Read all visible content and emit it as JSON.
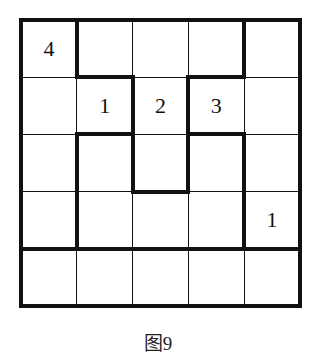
{
  "puzzle": {
    "rows": 5,
    "cols": 5,
    "cells": [
      [
        "4",
        "",
        "",
        "",
        ""
      ],
      [
        "",
        "1",
        "2",
        "3",
        ""
      ],
      [
        "",
        "",
        "",
        "",
        ""
      ],
      [
        "",
        "",
        "",
        "",
        "1"
      ],
      [
        "",
        "",
        "",
        "",
        ""
      ]
    ],
    "thick_vertical": [
      [
        0,
        1
      ],
      [
        0,
        4
      ],
      [
        1,
        2
      ],
      [
        1,
        3
      ],
      [
        2,
        1
      ],
      [
        2,
        2
      ],
      [
        2,
        3
      ],
      [
        2,
        4
      ],
      [
        3,
        1
      ],
      [
        3,
        4
      ]
    ],
    "thick_horizontal": [
      [
        1,
        1
      ],
      [
        1,
        3
      ],
      [
        2,
        1
      ],
      [
        2,
        3
      ],
      [
        3,
        2
      ],
      [
        4,
        0
      ],
      [
        4,
        1
      ],
      [
        4,
        2
      ],
      [
        4,
        3
      ],
      [
        4,
        4
      ]
    ]
  },
  "caption": "图9"
}
